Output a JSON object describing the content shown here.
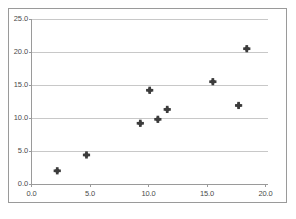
{
  "chart_data": {
    "type": "scatter",
    "title": "",
    "subtitle": "",
    "xlabel": "",
    "ylabel": "",
    "xlim": [
      0.0,
      20.0
    ],
    "ylim": [
      0.0,
      25.0
    ],
    "grid": true,
    "grid_axis": "y",
    "legend": false,
    "legend_position": "none",
    "marker": {
      "shape": "diamond-plus",
      "color": "#3c3c3c",
      "size": 5
    },
    "xticks": [
      0.0,
      5.0,
      10.0,
      15.0,
      20.0
    ],
    "yticks": [
      0.0,
      5.0,
      10.0,
      15.0,
      20.0,
      25.0
    ],
    "xtick_labels": [
      "0.0",
      "5.0",
      "10.0",
      "15.0",
      "20.0"
    ],
    "ytick_labels": [
      "0.0",
      "5.0",
      "10.0",
      "15.0",
      "20.0",
      "25.0"
    ],
    "series": [
      {
        "name": "series-1",
        "x": [
          2.2,
          4.7,
          9.3,
          10.1,
          10.8,
          11.6,
          15.5,
          17.7,
          18.4
        ],
        "y": [
          2.0,
          4.4,
          9.2,
          14.2,
          9.8,
          11.3,
          15.5,
          11.9,
          20.5
        ]
      }
    ],
    "points": [
      {
        "x": 2.2,
        "y": 2.0
      },
      {
        "x": 4.7,
        "y": 4.4
      },
      {
        "x": 9.3,
        "y": 9.2
      },
      {
        "x": 10.1,
        "y": 14.2
      },
      {
        "x": 10.8,
        "y": 9.8
      },
      {
        "x": 11.6,
        "y": 11.3
      },
      {
        "x": 15.5,
        "y": 15.5
      },
      {
        "x": 17.7,
        "y": 11.9
      },
      {
        "x": 18.4,
        "y": 20.5
      }
    ],
    "colors": {
      "marker": "#3c3c3c",
      "gridline": "#c8c8c8",
      "axis": "#9a9a9a",
      "frame": "#9a9a9a",
      "tick_text": "#4a4a4a",
      "background": "#ffffff"
    }
  }
}
